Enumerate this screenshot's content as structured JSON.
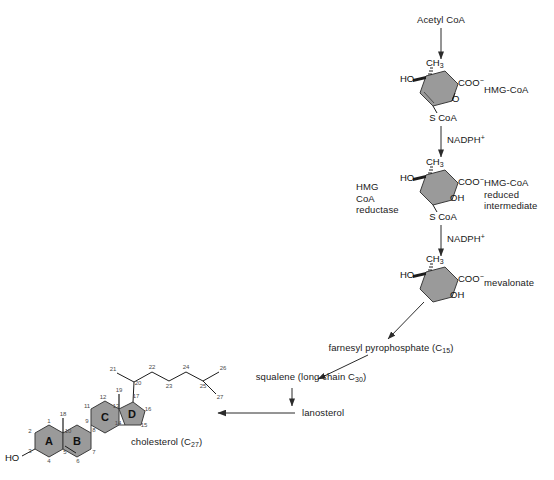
{
  "figure": {
    "colors": {
      "ring_fill": "#9a9a9a",
      "ring_stroke": "#3b3b3b",
      "arrow": "#2b2b2b",
      "text": "#1a1a1a",
      "carbon_number": "#4a4a4a"
    }
  },
  "pathway": {
    "start_label": "Acetyl CoA",
    "cofactor_1": "NADPH",
    "cofactor_1_charge": "+",
    "cofactor_2": "NADPH",
    "cofactor_2_charge": "+",
    "enzyme": {
      "line1": "HMG",
      "line2": "CoA",
      "line3": "reductase"
    },
    "products": {
      "hmg_coa": "HMG-CoA",
      "reduced_intermediate_line1": "HMG-CoA",
      "reduced_intermediate_line2": "reduced",
      "reduced_intermediate_line3": "intermediate",
      "mevalonate": "mevalonate"
    },
    "farnesyl": {
      "text": "farnesyl pyrophosphate (C",
      "subscript": "15",
      "tail": ")"
    },
    "squalene": {
      "text": "squalene (long chain C",
      "subscript": "30",
      "tail": ")"
    },
    "lanosterol": "lanosterol",
    "cholesterol": {
      "text": "cholesterol (C",
      "subscript": "27",
      "tail": ")"
    }
  },
  "structures": {
    "hmg_coa": {
      "name": "HMG-CoA",
      "atoms": {
        "methyl": "CH",
        "methyl_sub": "3",
        "hydroxyl_left": "HO",
        "carboxylate": "COO",
        "carboxylate_charge": "−",
        "ring_oxygen": "O",
        "thioester": "S CoA"
      }
    },
    "hmg_coa_reduced": {
      "name": "HMG-CoA reduced intermediate",
      "atoms": {
        "methyl": "CH",
        "methyl_sub": "3",
        "hydroxyl_left": "HO",
        "carboxylate": "COO",
        "carboxylate_charge": "−",
        "hydroxyl_right": "OH",
        "thioester": "S CoA"
      }
    },
    "mevalonate": {
      "name": "mevalonate",
      "atoms": {
        "methyl": "CH",
        "methyl_sub": "3",
        "hydroxyl_left": "HO",
        "carboxylate": "COO",
        "carboxylate_charge": "−",
        "hydroxyl_right": "OH"
      }
    },
    "cholesterol": {
      "name": "cholesterol",
      "hydroxyl": "HO",
      "ring_letters": [
        "A",
        "B",
        "C",
        "D"
      ],
      "carbon_numbers": [
        "1",
        "2",
        "3",
        "4",
        "5",
        "6",
        "7",
        "8",
        "9",
        "10",
        "11",
        "12",
        "13",
        "14",
        "15",
        "16",
        "17",
        "18",
        "19",
        "20",
        "21",
        "22",
        "23",
        "24",
        "25",
        "26",
        "27"
      ]
    }
  }
}
